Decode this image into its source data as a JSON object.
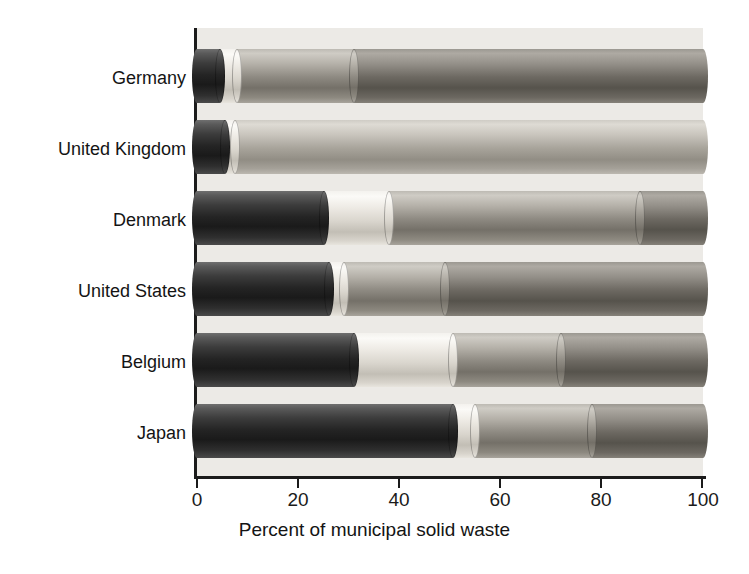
{
  "chart_data": {
    "type": "bar",
    "orientation": "horizontal",
    "stacked": true,
    "title": "",
    "xlabel": "Percent of municipal solid waste",
    "ylabel": "",
    "xlim": [
      0,
      100
    ],
    "xticks": [
      0,
      20,
      40,
      60,
      80,
      100
    ],
    "xtick_labels": [
      "0",
      "20",
      "40",
      "60",
      "80",
      "100"
    ],
    "grid": false,
    "legend": "none",
    "categories": [
      "Germany",
      "United Kingdom",
      "Denmark",
      "United States",
      "Belgium",
      "Japan"
    ],
    "series": [
      {
        "name": "segment-1-dark",
        "values": [
          4.5,
          5.5,
          25.0,
          26.0,
          31.0,
          50.5
        ]
      },
      {
        "name": "segment-2-white",
        "values": [
          3.5,
          2.0,
          13.0,
          3.0,
          19.5,
          4.5
        ]
      },
      {
        "name": "segment-3-light-grey",
        "values": [
          23.0,
          92.5,
          49.5,
          20.0,
          21.5,
          23.0
        ]
      },
      {
        "name": "segment-4-grey",
        "values": [
          69.0,
          0.0,
          12.5,
          51.0,
          28.0,
          22.0
        ]
      }
    ]
  },
  "axis": {
    "x_title": "Percent of municipal solid waste",
    "ticks": [
      {
        "value": 0,
        "label": "0"
      },
      {
        "value": 20,
        "label": "20"
      },
      {
        "value": 40,
        "label": "40"
      },
      {
        "value": 60,
        "label": "60"
      },
      {
        "value": 80,
        "label": "80"
      },
      {
        "value": 100,
        "label": "100"
      }
    ]
  },
  "rows": [
    {
      "label": "Germany",
      "segments": [
        4.5,
        3.5,
        23.0,
        69.0
      ]
    },
    {
      "label": "United Kingdom",
      "segments": [
        5.5,
        2.0,
        92.5,
        0.0
      ]
    },
    {
      "label": "Denmark",
      "segments": [
        25.0,
        13.0,
        49.5,
        12.5
      ]
    },
    {
      "label": "United States",
      "segments": [
        26.0,
        3.0,
        20.0,
        51.0
      ]
    },
    {
      "label": "Belgium",
      "segments": [
        31.0,
        19.5,
        21.5,
        28.0
      ]
    },
    {
      "label": "Japan",
      "segments": [
        50.5,
        4.5,
        23.0,
        22.0
      ]
    }
  ],
  "colors": {
    "segment_1": "#242424",
    "segment_2": "#e9e6df",
    "segment_3": "#a8a49b",
    "segment_4": "#6d6962",
    "plot_background": "#eceae6",
    "axis": "#1b1b1b",
    "text": "#141414"
  }
}
